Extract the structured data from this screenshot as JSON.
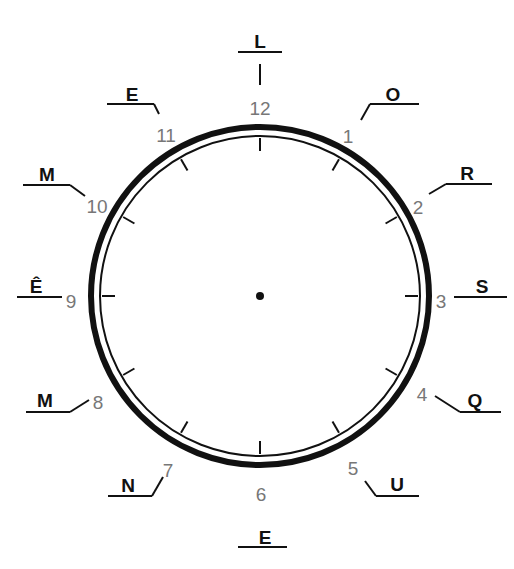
{
  "diagram": {
    "type": "clock-letter-puzzle",
    "center": [
      260,
      296
    ],
    "outer_ring_radius": 169,
    "inner_ring_radius": 160,
    "dot_radius": 4,
    "colors": {
      "ring": "#111111",
      "number": "#777777",
      "letter": "#111111"
    },
    "positions": [
      {
        "hour": "12",
        "letter": "L",
        "num_xy": [
          260,
          110
        ],
        "letter_xy": [
          260,
          43
        ],
        "line": [
          [
            238,
            52
          ],
          [
            282,
            52
          ]
        ],
        "leader": [
          [
            260,
            64
          ],
          [
            260,
            85
          ]
        ]
      },
      {
        "hour": "1",
        "letter": "O",
        "num_xy": [
          348,
          138
        ],
        "letter_xy": [
          393,
          96
        ],
        "line": [
          [
            370,
            104
          ],
          [
            419,
            104
          ]
        ],
        "leader": [
          [
            370,
            104
          ],
          [
            361,
            120
          ]
        ]
      },
      {
        "hour": "2",
        "letter": "R",
        "num_xy": [
          418,
          209
        ],
        "letter_xy": [
          467,
          175
        ],
        "line": [
          [
            446,
            184
          ],
          [
            492,
            184
          ]
        ],
        "leader": [
          [
            446,
            184
          ],
          [
            429,
            194
          ]
        ]
      },
      {
        "hour": "3",
        "letter": "S",
        "num_xy": [
          441,
          303
        ],
        "letter_xy": [
          482,
          288
        ],
        "line": [
          [
            454,
            297
          ],
          [
            507,
            297
          ]
        ],
        "leader": null
      },
      {
        "hour": "4",
        "letter": "Q",
        "num_xy": [
          422,
          396
        ],
        "letter_xy": [
          475,
          402
        ],
        "line": [
          [
            460,
            412
          ],
          [
            501,
            412
          ]
        ],
        "leader": [
          [
            460,
            412
          ],
          [
            435,
            396
          ]
        ]
      },
      {
        "hour": "5",
        "letter": "U",
        "num_xy": [
          353,
          470
        ],
        "letter_xy": [
          397,
          486
        ],
        "line": [
          [
            376,
            496
          ],
          [
            419,
            496
          ]
        ],
        "leader": [
          [
            376,
            496
          ],
          [
            365,
            481
          ]
        ]
      },
      {
        "hour": "6",
        "letter": "E",
        "num_xy": [
          261,
          496
        ],
        "letter_xy": [
          265,
          539
        ],
        "line": [
          [
            238,
            547
          ],
          [
            287,
            547
          ]
        ],
        "leader": null
      },
      {
        "hour": "7",
        "letter": "N",
        "num_xy": [
          168,
          472
        ],
        "letter_xy": [
          128,
          487
        ],
        "line": [
          [
            108,
            496
          ],
          [
            152,
            496
          ]
        ],
        "leader": [
          [
            152,
            496
          ],
          [
            163,
            477
          ]
        ]
      },
      {
        "hour": "8",
        "letter": "M",
        "num_xy": [
          98,
          404
        ],
        "letter_xy": [
          45,
          402
        ],
        "line": [
          [
            26,
            412
          ],
          [
            70,
            412
          ]
        ],
        "leader": [
          [
            70,
            412
          ],
          [
            89,
            400
          ]
        ]
      },
      {
        "hour": "9",
        "letter": "Ê",
        "num_xy": [
          71,
          303
        ],
        "letter_xy": [
          36,
          288
        ],
        "line": [
          [
            17,
            297
          ],
          [
            62,
            297
          ]
        ],
        "leader": null
      },
      {
        "hour": "10",
        "letter": "M",
        "num_xy": [
          97,
          208
        ],
        "letter_xy": [
          47,
          176
        ],
        "line": [
          [
            23,
            185
          ],
          [
            70,
            185
          ]
        ],
        "leader": [
          [
            70,
            185
          ],
          [
            85,
            196
          ]
        ]
      },
      {
        "hour": "11",
        "letter": "E",
        "num_xy": [
          166,
          137
        ],
        "letter_xy": [
          132,
          96
        ],
        "line": [
          [
            107,
            104
          ],
          [
            154,
            104
          ]
        ],
        "leader": [
          [
            154,
            104
          ],
          [
            159,
            114
          ]
        ]
      }
    ],
    "tick_inner_radius": 145,
    "tick_outer_radius": 158
  }
}
